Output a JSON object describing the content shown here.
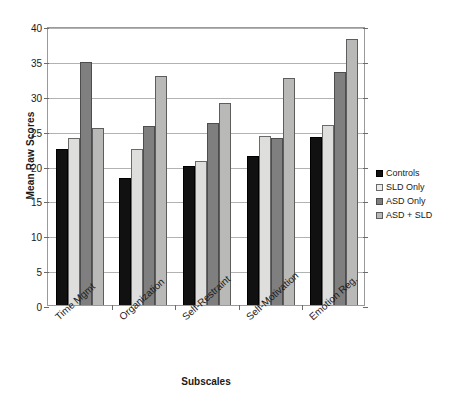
{
  "chart_data": {
    "type": "bar",
    "title": "",
    "xlabel": "Subscales",
    "ylabel": "Mean Raw Scores",
    "ylim": [
      0,
      40
    ],
    "ytick_step": 5,
    "yticks": [
      0,
      5,
      10,
      15,
      20,
      25,
      30,
      35,
      40
    ],
    "grid": true,
    "legend_position": "right",
    "categories": [
      "Time Mgmt",
      "Organization",
      "Self-Restraint",
      "Self-Motivation",
      "Emotion Reg."
    ],
    "series": [
      {
        "name": "Controls",
        "color": "#111111",
        "values": [
          22.3,
          18.2,
          19.9,
          21.4,
          24.1
        ]
      },
      {
        "name": "SLD Only",
        "color": "#dededd",
        "values": [
          24.0,
          22.4,
          20.6,
          24.2,
          25.8
        ]
      },
      {
        "name": "ASD Only",
        "color": "#7f7f7f",
        "values": [
          34.8,
          25.6,
          26.1,
          23.9,
          33.4
        ]
      },
      {
        "name": "ASD + SLD",
        "color": "#b9b9b7",
        "values": [
          25.4,
          32.8,
          29.0,
          32.6,
          38.1
        ]
      }
    ]
  }
}
